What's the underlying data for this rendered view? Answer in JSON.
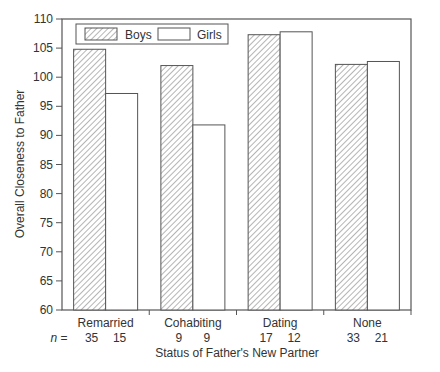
{
  "chart_data": {
    "type": "bar",
    "title": "",
    "xlabel": "Status of Father's New Partner",
    "ylabel": "Overall Closeness to Father",
    "ylim": [
      60,
      110
    ],
    "yticks": [
      60,
      65,
      70,
      75,
      80,
      85,
      90,
      95,
      100,
      105,
      110
    ],
    "categories": [
      "Remarried",
      "Cohabiting",
      "Dating",
      "None"
    ],
    "series": [
      {
        "name": "Boys",
        "pattern": "hatched",
        "values": [
          104.8,
          102.0,
          107.3,
          102.2
        ],
        "n": [
          35,
          9,
          17,
          33
        ]
      },
      {
        "name": "Girls",
        "pattern": "white",
        "values": [
          97.2,
          91.8,
          107.8,
          102.7
        ],
        "n": [
          15,
          9,
          12,
          21
        ]
      }
    ],
    "n_label": "n =",
    "legend_position": "top-left inside",
    "grid": false
  },
  "colors": {
    "axis": "#555555",
    "bar_edge": "#555555",
    "hatch": "#777777"
  }
}
